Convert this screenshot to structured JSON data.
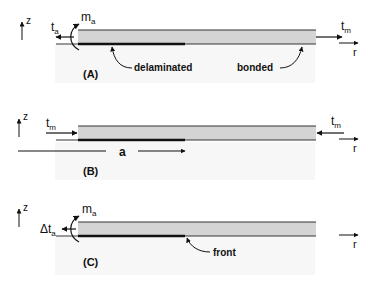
{
  "colors": {
    "layer_fill": "#d4d4d4",
    "line": "#222222",
    "bg_panel": "#f6f6f6"
  },
  "panels": [
    {
      "id": "A",
      "label": "(A)",
      "z_axis": "z",
      "r_axis": "r",
      "left_force": "t",
      "left_force_sub": "a",
      "moment": "m",
      "moment_sub": "a",
      "right_force": "t",
      "right_force_sub": "m",
      "annotation_left": "delaminated",
      "annotation_right": "bonded"
    },
    {
      "id": "B",
      "label": "(B)",
      "z_axis": "z",
      "r_axis": "r",
      "left_force": "t",
      "left_force_sub": "m",
      "right_force": "t",
      "right_force_sub": "m",
      "dimension": "a"
    },
    {
      "id": "C",
      "label": "(C)",
      "z_axis": "z",
      "r_axis": "r",
      "left_force": "Δt",
      "left_force_sub": "a",
      "moment": "m",
      "moment_sub": "a",
      "annotation": "front"
    }
  ]
}
